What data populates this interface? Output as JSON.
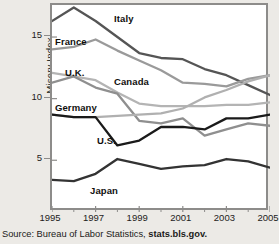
{
  "chart_data": {
    "type": "line",
    "title": "",
    "xlabel": "",
    "ylabel": "Misery Index",
    "xlim": [
      1995,
      2005
    ],
    "ylim": [
      0.8,
      17.6
    ],
    "yticks": [
      5,
      10,
      15
    ],
    "ytick_labels": [
      "5",
      "10",
      "15"
    ],
    "xticks": [
      1995,
      1997,
      1999,
      2001,
      2003,
      2005
    ],
    "xtick_labels": [
      "1995",
      "1997",
      "1999",
      "2001",
      "2003",
      "2005"
    ],
    "x": [
      1995,
      1996,
      1997,
      1998,
      1999,
      2000,
      2001,
      2002,
      2003,
      2004,
      2005
    ],
    "grid": false,
    "legend_position": "in-plot labels",
    "series": [
      {
        "name": "Italy",
        "color": "#555555",
        "values": [
          16.3,
          17.4,
          16.3,
          15.0,
          13.7,
          13.3,
          13.2,
          12.4,
          11.9,
          11.1,
          10.3
        ]
      },
      {
        "name": "France",
        "color": "#9a9a9a",
        "values": [
          14.0,
          14.2,
          14.8,
          13.9,
          13.1,
          12.3,
          11.3,
          11.2,
          11.0,
          11.6,
          11.9
        ]
      },
      {
        "name": "U.K.",
        "color": "#b4b4b4",
        "values": [
          12.1,
          11.8,
          11.5,
          10.5,
          9.6,
          9.4,
          9.4,
          9.4,
          9.5,
          9.5,
          9.7
        ]
      },
      {
        "name": "Canada",
        "color": "#8f8f8f",
        "values": [
          11.3,
          11.8,
          10.9,
          10.4,
          8.2,
          8.0,
          8.4,
          7.0,
          7.5,
          8.0,
          7.8
        ]
      },
      {
        "name": "Germany",
        "color": "#b0b0b0",
        "values": [
          8.7,
          8.5,
          8.5,
          8.6,
          8.7,
          8.8,
          9.2,
          10.1,
          10.7,
          11.4,
          11.9
        ]
      },
      {
        "name": "U.S.",
        "color": "#1a1a1a",
        "values": [
          8.7,
          8.5,
          8.5,
          6.2,
          6.6,
          7.7,
          7.7,
          7.5,
          8.4,
          8.4,
          8.7
        ]
      },
      {
        "name": "Japan",
        "color": "#333333",
        "values": [
          3.4,
          3.3,
          3.9,
          5.1,
          4.7,
          4.3,
          4.5,
          4.6,
          5.1,
          4.9,
          4.4
        ]
      }
    ],
    "series_labels": [
      {
        "text": "Italy",
        "x": 62,
        "y": 8
      },
      {
        "text": "France",
        "x": 3,
        "y": 31
      },
      {
        "text": "U.K.",
        "x": 13,
        "y": 62
      },
      {
        "text": "Canada",
        "x": 62,
        "y": 71
      },
      {
        "text": "Germany",
        "x": 3,
        "y": 97
      },
      {
        "text": "U.S.",
        "x": 45,
        "y": 130
      },
      {
        "text": "Japan",
        "x": 38,
        "y": 180
      }
    ]
  },
  "axis": {
    "y_title": "Misery Index"
  },
  "source": {
    "prefix": "Source: Bureau of Labor Statistics, ",
    "url": "stats.bls.gov."
  }
}
